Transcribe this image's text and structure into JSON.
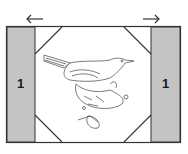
{
  "diagram": {
    "left_panel": {
      "label": "1",
      "fill": "#c4c4c4"
    },
    "right_panel": {
      "label": "1",
      "fill": "#c4c4c4"
    },
    "left_arrow": "left-arrow",
    "right_arrow": "right-arrow",
    "center_motif": "bird-on-branch-illustration",
    "border_color": "#333333"
  }
}
